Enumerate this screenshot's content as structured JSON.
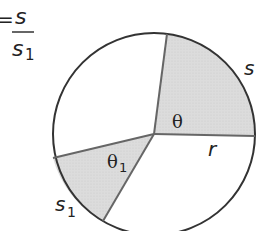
{
  "formula": {
    "prefix": "=",
    "numerator": "s",
    "denominator": "s",
    "denominator_subscript": "1"
  },
  "circle": {
    "center": [
      154,
      134
    ],
    "radius": 101,
    "stroke_color": "#333333",
    "shade_color": "#d9d9d9"
  },
  "sectors": [
    {
      "angle_label": "θ",
      "angle_subscript": "",
      "arc_label": "s",
      "arc_subscript": ""
    },
    {
      "angle_label": "θ",
      "angle_subscript": "1",
      "arc_label": "s",
      "arc_subscript": "1"
    }
  ],
  "radius_label": "r"
}
